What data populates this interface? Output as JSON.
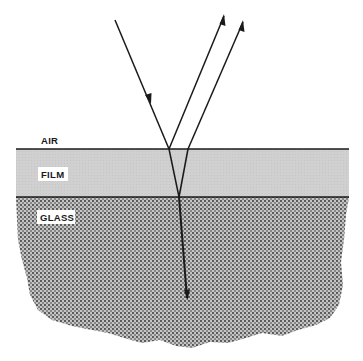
{
  "diagram": {
    "layers": [
      {
        "name": "air",
        "label": "AIR"
      },
      {
        "name": "film",
        "label": "FILM"
      },
      {
        "name": "glass",
        "label": "GLASS"
      }
    ],
    "rays": [
      {
        "name": "incident-ray",
        "description": "Incoming light ray striking film surface"
      },
      {
        "name": "reflected-ray-film-surface",
        "description": "Ray reflected from top (air/film) surface"
      },
      {
        "name": "reflected-ray-glass-surface",
        "description": "Ray reflected from film/glass interface, exiting film"
      },
      {
        "name": "transmitted-ray",
        "description": "Ray refracted into glass"
      }
    ],
    "colors": {
      "line": "#1a1a1a",
      "film_fill": "#cfcfcf",
      "glass_fill": "#9a9a9a",
      "background": "#ffffff"
    }
  }
}
